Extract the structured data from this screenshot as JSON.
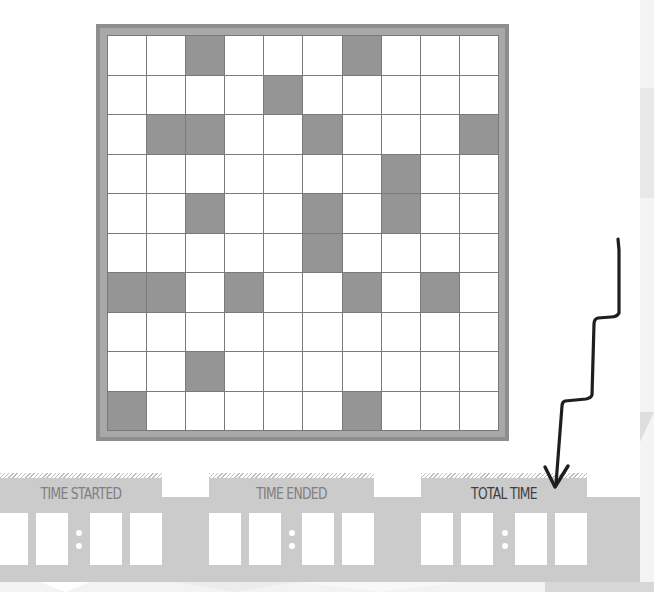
{
  "board": {
    "rows": 10,
    "cols": 10,
    "filled_cells": [
      [
        0,
        2
      ],
      [
        0,
        6
      ],
      [
        1,
        4
      ],
      [
        2,
        1
      ],
      [
        2,
        2
      ],
      [
        2,
        5
      ],
      [
        2,
        9
      ],
      [
        3,
        7
      ],
      [
        4,
        2
      ],
      [
        4,
        5
      ],
      [
        4,
        7
      ],
      [
        5,
        5
      ],
      [
        6,
        0
      ],
      [
        6,
        1
      ],
      [
        6,
        3
      ],
      [
        6,
        6
      ],
      [
        6,
        8
      ],
      [
        8,
        2
      ],
      [
        9,
        0
      ],
      [
        9,
        6
      ]
    ],
    "colors": {
      "frame": "#8e8e8e",
      "filled": "#959595",
      "empty": "#ffffff",
      "grid_line": "#7a7a7a"
    }
  },
  "timers": [
    {
      "label": "TIME STARTED",
      "digits": [
        "",
        "",
        "",
        ""
      ],
      "highlighted": false
    },
    {
      "label": "TIME ENDED",
      "digits": [
        "",
        "",
        "",
        ""
      ],
      "highlighted": false
    },
    {
      "label": "TOTAL TIME",
      "digits": [
        "",
        "",
        "",
        ""
      ],
      "highlighted": true
    }
  ],
  "annotation": {
    "arrow_target": "TOTAL TIME",
    "arrow_icon": "hand-drawn-zigzag-arrow-icon"
  },
  "colors": {
    "band": "#cbcbcb",
    "label": "#7f7f7f",
    "label_highlight": "#3e3e3e",
    "arrow": "#1e1e1e"
  }
}
